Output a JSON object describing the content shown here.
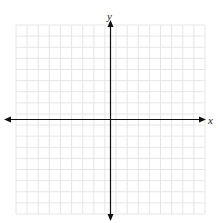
{
  "figure": {
    "type": "coordinate-grid",
    "top_text": "",
    "x_axis_label": "x",
    "y_axis_label": "y",
    "grid_cells_x": 17,
    "grid_cells_y": 17,
    "x_range": [
      -8.5,
      8.5
    ],
    "y_range": [
      -8.5,
      8.5
    ],
    "grid_color": "#e6e6e6",
    "axis_color": "#111111",
    "axes_have_arrows": true
  }
}
